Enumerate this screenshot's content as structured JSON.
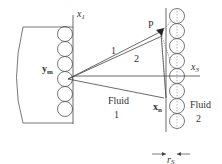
{
  "labels": {
    "x1": "x",
    "x1_sub": "1",
    "x3": "x",
    "x3_sub": "3",
    "P": "P",
    "ym": "y",
    "ym_sub": "m",
    "xn": "x",
    "xn_sub": "n",
    "path1": "1",
    "path2": "2",
    "fluid1_line1": "Fluid",
    "fluid1_line2": "1",
    "fluid2_line1": "Fluid",
    "fluid2_line2": "2",
    "rs": "r",
    "rs_sub": "S"
  },
  "colors": {
    "stroke": "#444444",
    "text": "#333333"
  }
}
